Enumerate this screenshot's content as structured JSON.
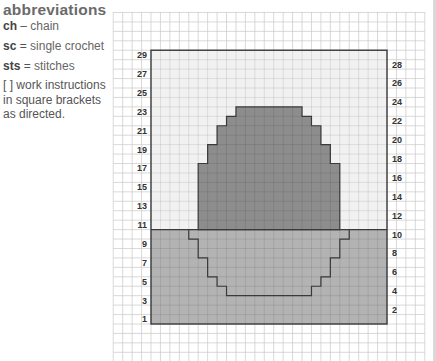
{
  "abbreviations": {
    "title": "abbreviations",
    "items": [
      {
        "abbr": "ch",
        "sep": " – ",
        "meaning": "chain"
      },
      {
        "abbr": "sc",
        "sep": " = ",
        "meaning": "single crochet"
      },
      {
        "abbr": "sts",
        "sep": " = ",
        "meaning": "stitches"
      }
    ],
    "bracket_note": {
      "abbr": "[ ]",
      "lines": [
        "work instructions",
        "in square brackets",
        "as directed."
      ]
    }
  },
  "chart": {
    "type": "crochet-colorwork-grid",
    "columns": 25,
    "rows": 29,
    "left_row_labels": [
      "29",
      "27",
      "25",
      "23",
      "21",
      "19",
      "17",
      "15",
      "13",
      "11",
      "9",
      "7",
      "5",
      "3",
      "1"
    ],
    "right_row_labels": [
      "28",
      "26",
      "24",
      "22",
      "20",
      "18",
      "16",
      "14",
      "12",
      "10",
      "8",
      "6",
      "4",
      "2"
    ],
    "colors": {
      "background_fill": "#f1f1f1",
      "lower_fill": "#b3b3b3",
      "dark_fill": "#8d8d8d",
      "grid_line": "#c9c9c9",
      "outline": "#3a3a3a"
    }
  },
  "chart_data": {
    "type": "heatmap",
    "title": "",
    "grid": {
      "columns": 25,
      "rows": 29
    },
    "regions": [
      {
        "name": "lower-band",
        "color": "light grey",
        "rows": [
          1,
          10
        ],
        "cols": [
          0,
          24
        ]
      },
      {
        "name": "dark-dome",
        "color": "dark grey",
        "row_spans": [
          {
            "rows": [
              11,
              17
            ],
            "cols": [
              5,
              19
            ]
          },
          {
            "rows": [
              18,
              19
            ],
            "cols": [
              6,
              18
            ]
          },
          {
            "rows": [
              20,
              21
            ],
            "cols": [
              7,
              17
            ]
          },
          {
            "rows": [
              22,
              22
            ],
            "cols": [
              8,
              16
            ]
          },
          {
            "rows": [
              23,
              23
            ],
            "cols": [
              9,
              15
            ]
          }
        ]
      },
      {
        "name": "bowl-outline",
        "color": "outline",
        "rows": [
          3,
          10
        ],
        "description": "stepped outline within lower band"
      }
    ],
    "left_labels": [
      29,
      27,
      25,
      23,
      21,
      19,
      17,
      15,
      13,
      11,
      9,
      7,
      5,
      3,
      1
    ],
    "right_labels": [
      28,
      26,
      24,
      22,
      20,
      18,
      16,
      14,
      12,
      10,
      8,
      6,
      4,
      2
    ]
  }
}
